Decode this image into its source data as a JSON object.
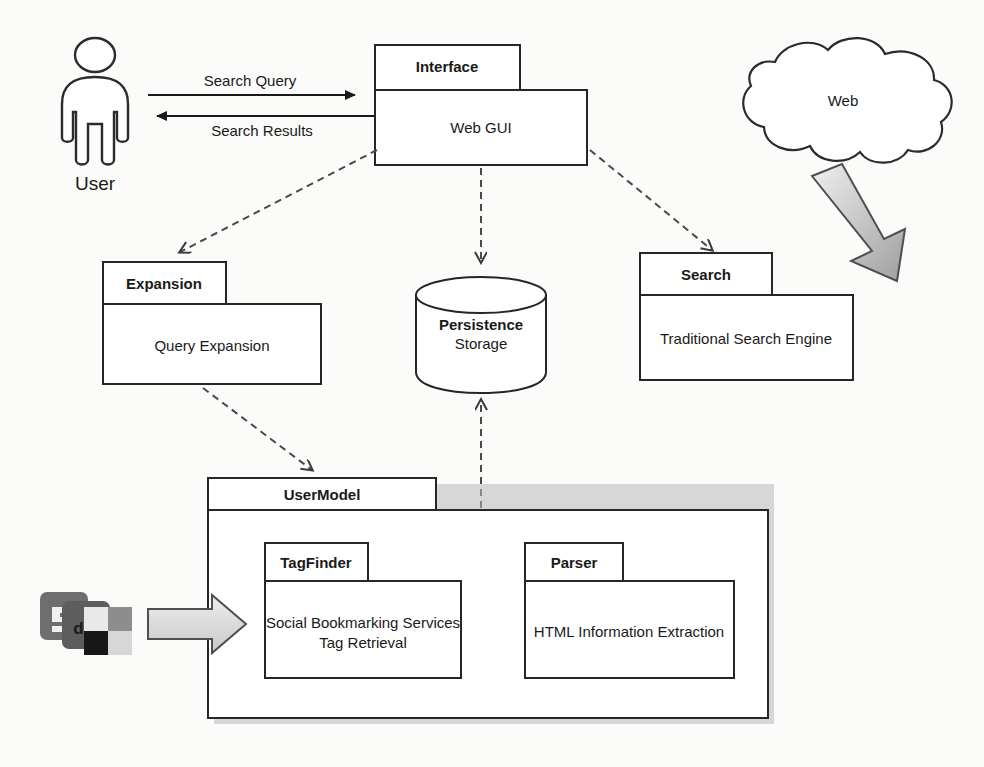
{
  "diagram": {
    "actor": {
      "label": "User",
      "icon": "person-icon"
    },
    "flows": [
      {
        "id": "search-query",
        "label": "Search Query",
        "direction": "user-to-interface"
      },
      {
        "id": "search-results",
        "label": "Search Results",
        "direction": "interface-to-user"
      }
    ],
    "cloud": {
      "label": "Web",
      "icon": "cloud-icon"
    },
    "datastore": {
      "name": "Persistence",
      "subtitle": "Storage",
      "icon": "database-cylinder-icon"
    },
    "packages": [
      {
        "id": "interface",
        "tab": "Interface",
        "body": "Web GUI"
      },
      {
        "id": "expansion",
        "tab": "Expansion",
        "body": "Query Expansion"
      },
      {
        "id": "search",
        "tab": "Search",
        "body": "Traditional Search Engine"
      },
      {
        "id": "usermodel",
        "tab": "UserModel",
        "body": ""
      },
      {
        "id": "tagfinder",
        "tab": "TagFinder",
        "body": "Social Bookmarking Services\nTag Retrieval",
        "body_lines": [
          "Social Bookmarking Services",
          "Tag Retrieval"
        ]
      },
      {
        "id": "parser",
        "tab": "Parser",
        "body": "HTML Information Extraction"
      }
    ],
    "bookmark_icons": {
      "name": "social-bookmarking-icons",
      "services": [
        "stumbleupon",
        "digg",
        "delicious"
      ],
      "labels": [
        "SI",
        "dig",
        ""
      ]
    },
    "dependencies": [
      {
        "from": "interface",
        "to": "expansion"
      },
      {
        "from": "interface",
        "to": "persistence"
      },
      {
        "from": "interface",
        "to": "search"
      },
      {
        "from": "expansion",
        "to": "usermodel"
      },
      {
        "from": "usermodel",
        "to": "persistence"
      }
    ],
    "colors": {
      "line": "#1a1a1a",
      "dashed": "#4a4a4a",
      "box_fill": "#ffffff",
      "gray_arrow_light": "#e6e6e6",
      "gray_arrow_dark": "#9a9a9a",
      "shadow": "#b9b9b9",
      "page_bg": "#fbfbfa"
    }
  }
}
